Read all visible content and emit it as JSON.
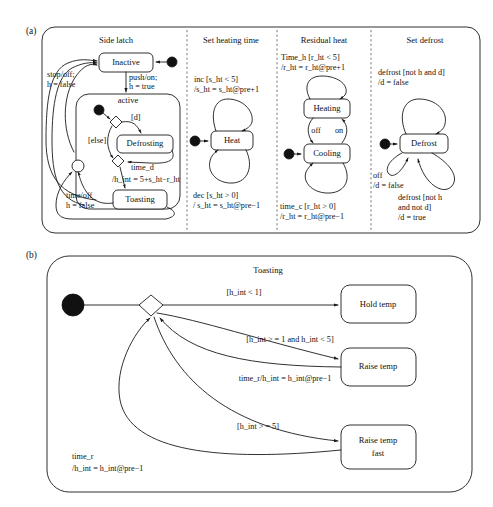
{
  "figure": {
    "panel_a_label": "(a)",
    "panel_b_label": "(b)"
  },
  "panel_a": {
    "regions": [
      {
        "id": "side-latch",
        "title": "Side latch",
        "states": [
          {
            "name": "Inactive"
          },
          {
            "name": "Defrosting"
          },
          {
            "name": "Toasting"
          }
        ],
        "composite_state": "active",
        "transitions": [
          {
            "trigger": "stop/off;",
            "action": "h = false"
          },
          {
            "trigger": "push/on;",
            "action": "h = true"
          },
          {
            "guard": "[d]"
          },
          {
            "guard": "[else]"
          },
          {
            "trigger": "time_d",
            "action": "/h_int = 5+s_ht−r_ht"
          },
          {
            "trigger": "time/off",
            "action": "h = false"
          }
        ]
      },
      {
        "id": "set-heating-time",
        "title": "Set heating time",
        "states": [
          {
            "name": "Heat"
          }
        ],
        "transitions": [
          {
            "trigger": "inc [s_ht < 5]",
            "action": "/s_ht = s_ht@pre+1"
          },
          {
            "trigger": "dec [s_ht > 0]",
            "action": "/ s_ht = s_ht@pre−1"
          }
        ]
      },
      {
        "id": "residual-heat",
        "title": "Residual heat",
        "states": [
          {
            "name": "Heating"
          },
          {
            "name": "Cooling"
          }
        ],
        "transitions": [
          {
            "trigger": "Time_h [r_ht < 5]",
            "action": "/r_ht = r_ht@pre+1"
          },
          {
            "trigger": "off"
          },
          {
            "trigger": "on"
          },
          {
            "trigger": "time_c [r_ht > 0]",
            "action": "/r_ht = r_ht@pre−1"
          }
        ]
      },
      {
        "id": "set-defrost",
        "title": "Set defrost",
        "states": [
          {
            "name": "Defrost"
          }
        ],
        "transitions": [
          {
            "trigger": "defrost [not h and d]",
            "action": "/d = false"
          },
          {
            "trigger": "off",
            "action": "/d = false"
          },
          {
            "trigger": "defrost [not h",
            "trigger2": "and not d]",
            "action": "/d = true"
          }
        ]
      }
    ]
  },
  "panel_b": {
    "title": "Toasting",
    "states": [
      {
        "name": "Hold temp"
      },
      {
        "name": "Raise temp"
      },
      {
        "name": "Raise temp",
        "name2": "fast"
      }
    ],
    "transitions": [
      {
        "label": "[h_int < 1]"
      },
      {
        "label": "[h_int > = 1 and h_int < 5]"
      },
      {
        "label": "time_r/h_int = h_int@pre−1"
      },
      {
        "label": "[h_int > = 5]"
      },
      {
        "label": "time_r",
        "label2": "/h_int = h_int@pre−1"
      }
    ]
  },
  "colors": {
    "stroke": "#1a1a1a",
    "divider": "#555555",
    "background": "#ffffff",
    "node_fill": "#111111"
  }
}
